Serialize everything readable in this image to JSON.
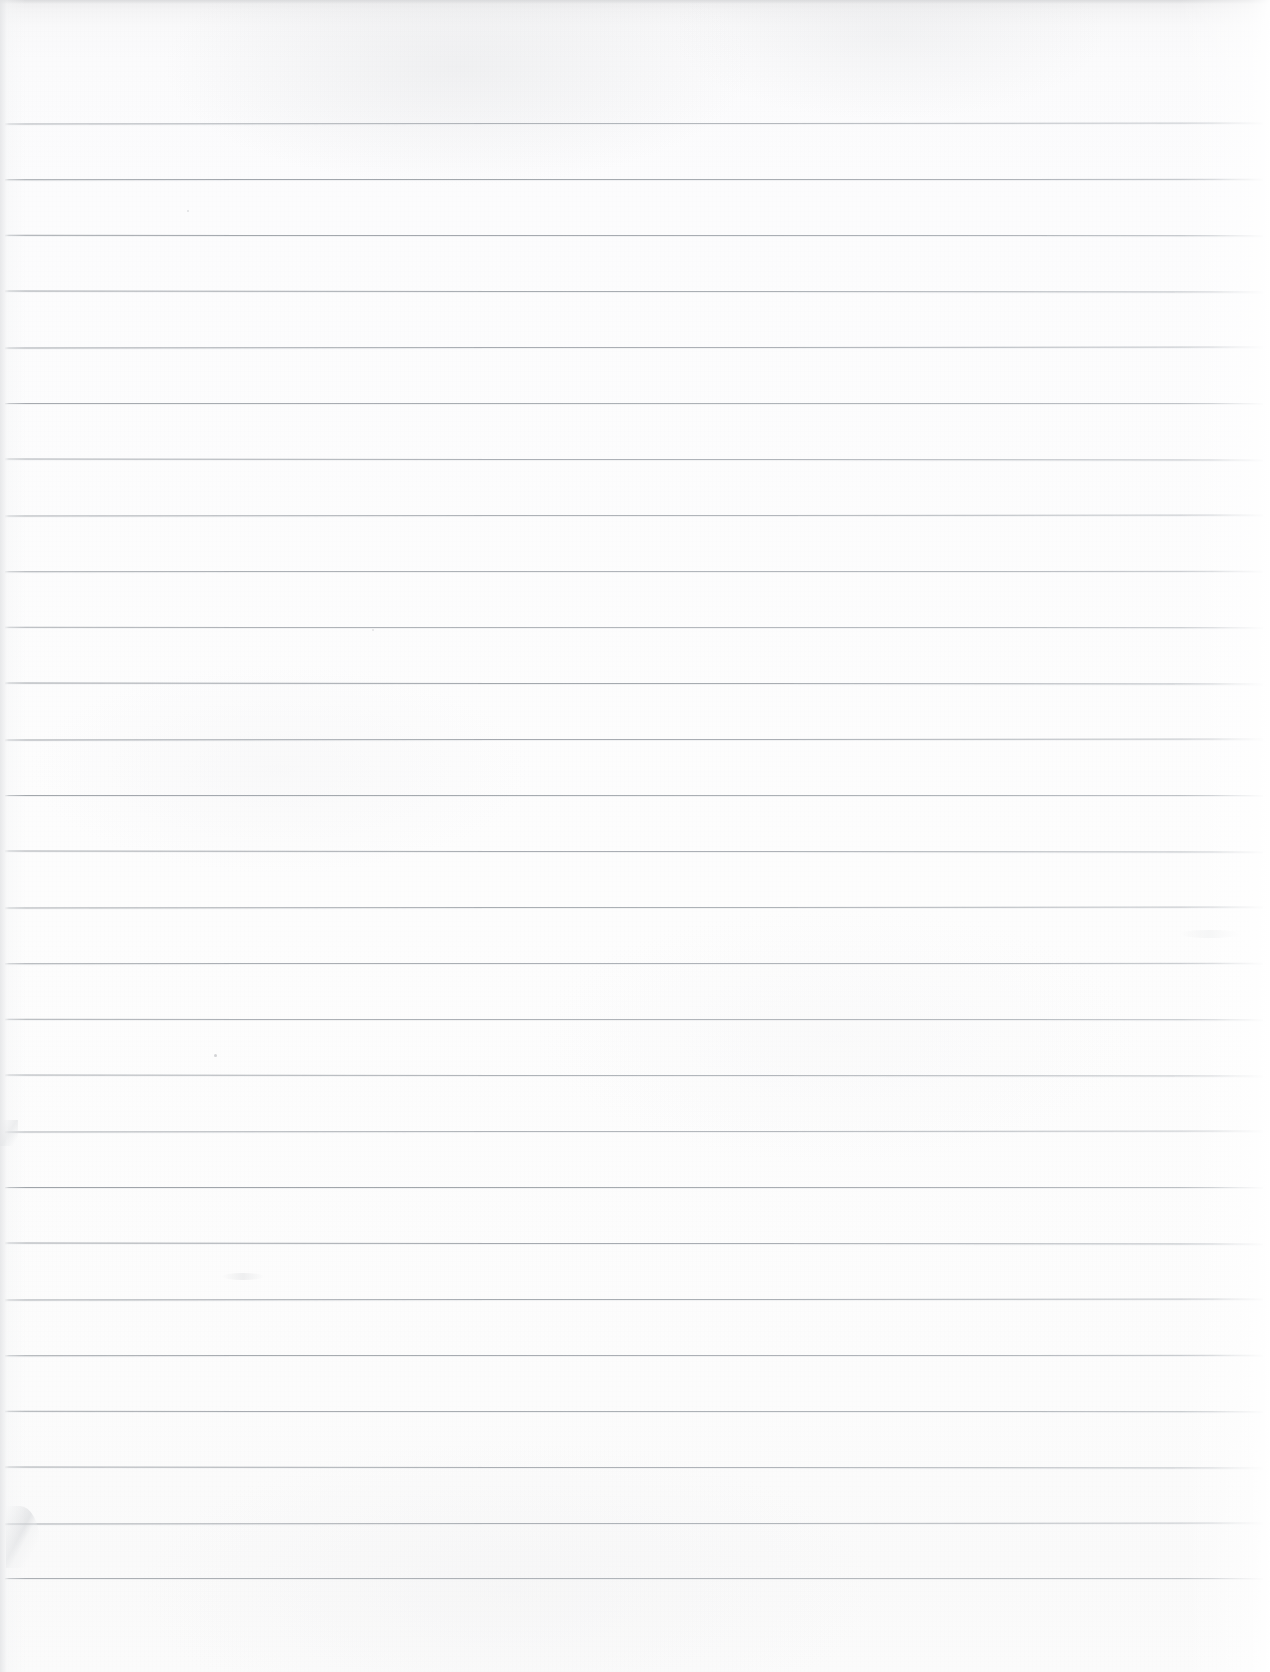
{
  "document": {
    "kind": "scanned-lined-paper",
    "title": "Blank Ruled Notebook Page",
    "page_width_px": 1270,
    "page_height_px": 1672,
    "orientation": "portrait",
    "has_text_content": false,
    "body_text": ""
  },
  "paper": {
    "background_color": "#fcfcfc",
    "top_edge_shade_color": "#ededee",
    "left_edge_shade_color": "#e4e5e7",
    "right_edge_highlight_color": "#ffffff",
    "texture": "fine paper grain with uneven scan illumination"
  },
  "ruling": {
    "line_color": "#a6abb1",
    "line_thickness_px": 1,
    "line_spacing_px": 56,
    "first_line_y_px": 123,
    "last_line_y_px": 1578,
    "line_start_x_px": 5,
    "line_end_x_px": 1263,
    "line_count": 27,
    "margin_rule": "none",
    "line_y_positions": [
      123,
      179,
      235,
      291,
      347,
      403,
      459,
      515,
      571,
      627,
      683,
      739,
      795,
      851,
      907,
      963,
      1019,
      1075,
      1131,
      1187,
      1243,
      1299,
      1355,
      1411,
      1467,
      1523,
      1578
    ]
  },
  "blemishes": [
    {
      "name": "crease-lower-left",
      "x": 6,
      "y": 1506,
      "description": "soft fold crease near lower-left edge"
    },
    {
      "name": "crease-left-mid",
      "x": 0,
      "y": 1120,
      "description": "faint nick on left edge"
    },
    {
      "name": "speck-upper-left",
      "x": 214,
      "y": 1054,
      "description": "small dark speck"
    },
    {
      "name": "speck-mid-upper",
      "x": 187,
      "y": 210,
      "description": "tiny speck"
    },
    {
      "name": "speck-mid",
      "x": 372,
      "y": 629,
      "description": "tiny speck"
    },
    {
      "name": "smudge-left-lower",
      "x": 222,
      "y": 1273,
      "description": "faint smudge"
    },
    {
      "name": "smudge-right-upper",
      "x": 1180,
      "y": 930,
      "description": "faint light smudge"
    }
  ]
}
